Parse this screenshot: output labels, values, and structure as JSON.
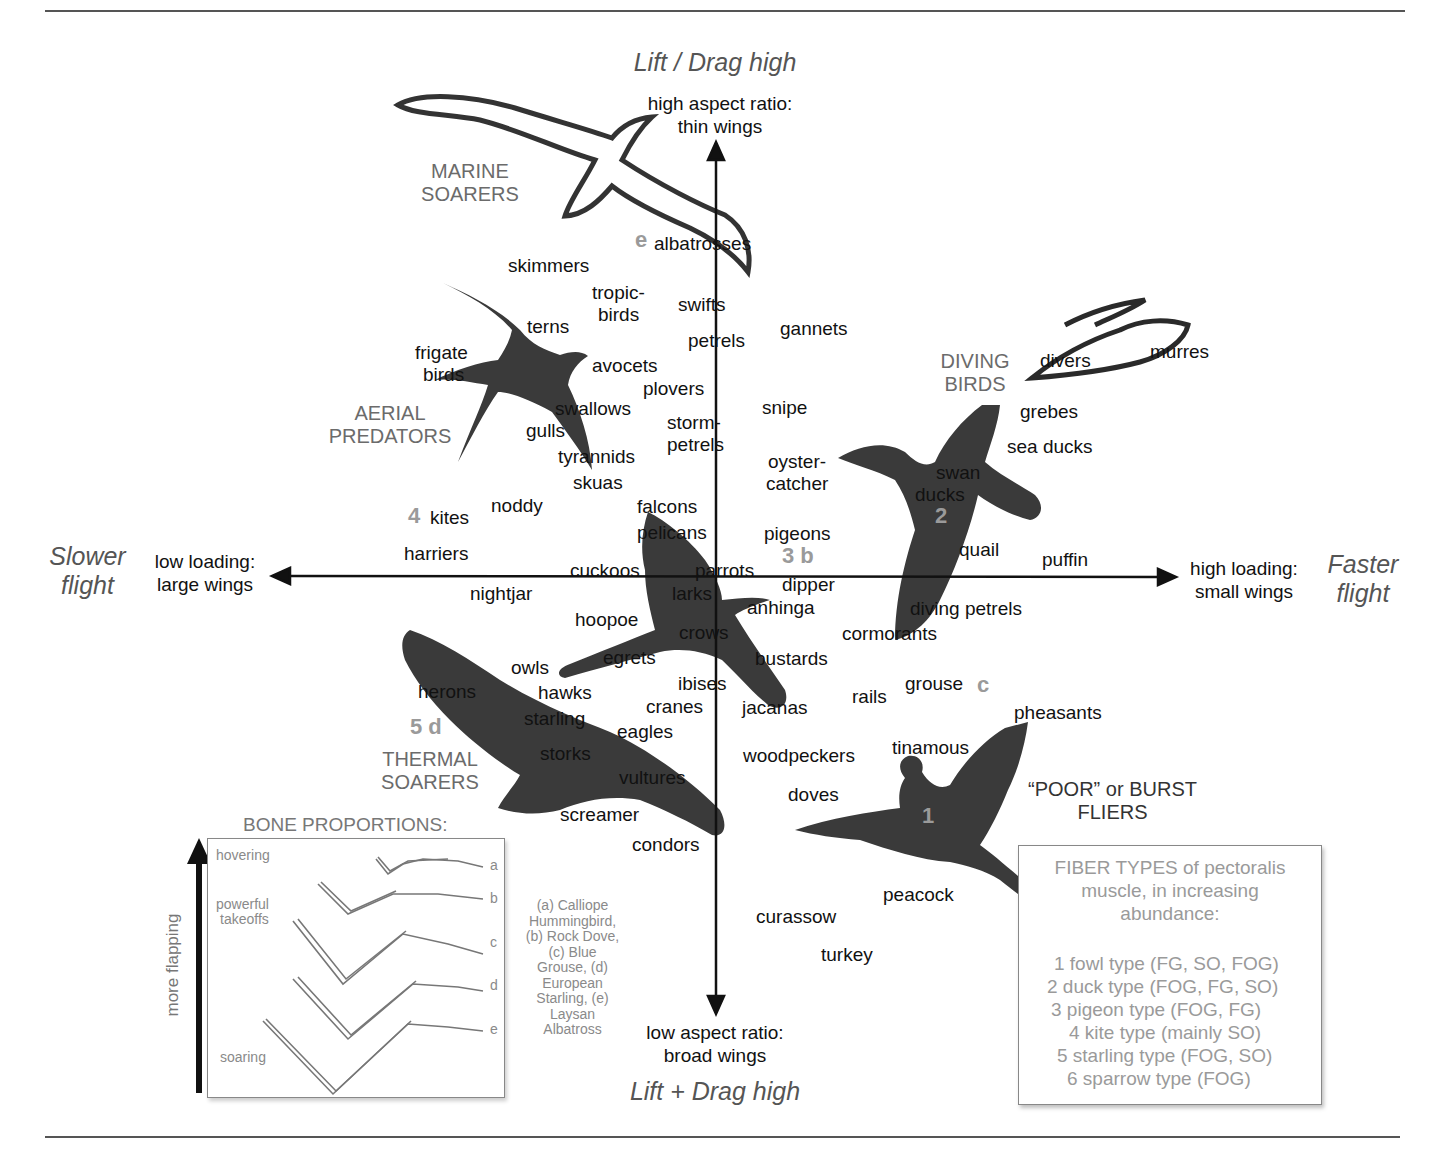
{
  "diagram": {
    "type": "morphospace",
    "axes": {
      "vertical": {
        "top_title": "Lift / Drag high",
        "top_sub": [
          "high aspect ratio:",
          "thin wings"
        ],
        "bottom_title": "Lift + Drag high",
        "bottom_sub": [
          "low aspect ratio:",
          "broad wings"
        ]
      },
      "horizontal": {
        "left_title": [
          "Slower",
          "flight"
        ],
        "left_sub": [
          "low loading:",
          "large wings"
        ],
        "right_title": [
          "Faster",
          "flight"
        ],
        "right_sub": [
          "high loading:",
          "small wings"
        ]
      }
    },
    "groups": [
      {
        "name": "marine-soarers",
        "label": [
          "MARINE",
          "SOARERS"
        ]
      },
      {
        "name": "aerial-predators",
        "label": [
          "AERIAL",
          "PREDATORS"
        ]
      },
      {
        "name": "diving-birds",
        "label": [
          "DIVING",
          "BIRDS"
        ]
      },
      {
        "name": "thermal-soarers",
        "label": [
          "THERMAL",
          "SOARERS"
        ]
      },
      {
        "name": "burst-fliers",
        "label": [
          "“POOR” or BURST",
          "FLIERS"
        ]
      }
    ],
    "markers": [
      {
        "num": "e",
        "near": "albatrosses"
      },
      {
        "num": "4",
        "near": "kites"
      },
      {
        "num": "3 b",
        "near": "pigeons"
      },
      {
        "num": "2",
        "near": "ducks"
      },
      {
        "num": "c",
        "near": "grouse"
      },
      {
        "num": "5 d",
        "near": "herons"
      },
      {
        "num": "1",
        "near": "pheasant silhouette"
      }
    ],
    "birds": [
      "albatrosses",
      "skimmers",
      "tropic-",
      "birds",
      "swifts",
      "gannets",
      "terns",
      "petrels",
      "frigate",
      "birds",
      "avocets",
      "plovers",
      "swallows",
      "snipe",
      "storm-",
      "petrels",
      "gulls",
      "tyrannids",
      "skuas",
      "oyster-",
      "catcher",
      "kites",
      "noddy",
      "falcons",
      "pelicans",
      "pigeons",
      "harriers",
      "cuckoos",
      "parrots",
      "dipper",
      "nightjar",
      "larks",
      "anhinga",
      "hoopoe",
      "crows",
      "owls",
      "egrets",
      "bustards",
      "herons",
      "hawks",
      "ibises",
      "cranes",
      "jacanas",
      "starling",
      "eagles",
      "storks",
      "vultures",
      "screamer",
      "condors",
      "woodpeckers",
      "doves",
      "rails",
      "grouse",
      "tinamous",
      "pheasants",
      "peacock",
      "curassow",
      "turkey",
      "divers",
      "murres",
      "grebes",
      "sea ducks",
      "swan",
      "ducks",
      "quail",
      "puffin",
      "diving petrels",
      "cormorants"
    ]
  },
  "bone_proportions": {
    "title": "BONE PROPORTIONS:",
    "arrow_label": "more flapping",
    "modes": [
      "hovering",
      "powerful",
      "takeoffs",
      "soaring"
    ],
    "letters": [
      "a",
      "b",
      "c",
      "d",
      "e"
    ],
    "species_caption": [
      "(a) Calliope",
      "Hummingbird,",
      "(b) Rock Dove,",
      "(c) Blue",
      "Grouse, (d)",
      "European",
      "Starling, (e)",
      "Laysan",
      "Albatross"
    ]
  },
  "fiber_types": {
    "title": [
      "FIBER TYPES of pectoralis",
      "muscle, in increasing",
      "abundance:"
    ],
    "items": [
      "1 fowl type (FG, SO, FOG)",
      "2 duck type (FOG, FG, SO)",
      "3 pigeon type (FOG, FG)",
      "4 kite type (mainly SO)",
      "5 starling type (FOG, SO)",
      "6 sparrow type (FOG)"
    ]
  },
  "colors": {
    "silhouette": "#3a3a3a",
    "group_label": "#6b6b6b",
    "marker_number": "#9a9a9a",
    "axis_line": "#111111",
    "rule_line": "#555555"
  }
}
